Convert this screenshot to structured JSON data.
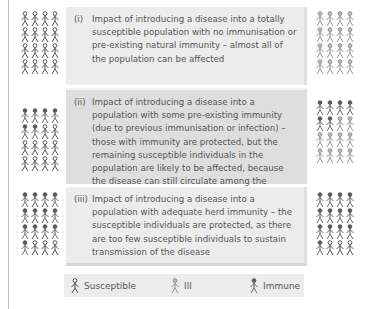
{
  "panels": [
    {
      "number": "(i)",
      "text": "Impact of introducing a disease into a totally susceptible population with no immunisation or pre-existing natural immunity – almost all of the population can be affected",
      "before": {
        "susceptible": 16,
        "ill": 0,
        "immune": 0
      },
      "after": {
        "susceptible": 0,
        "ill": 16,
        "immune": 0
      }
    },
    {
      "number": "(ii)",
      "text": "Impact of introducing a disease into a population with some pre-existing immunity (due to previous immunisation or infection) – those with immunity are protected, but the remaining susceptible individuals in the population are likely to be affected, because the disease can still circulate among the susceptible population",
      "before": {
        "susceptible": 10,
        "ill": 0,
        "immune": 6
      },
      "after": {
        "susceptible": 0,
        "ill": 10,
        "immune": 6
      }
    },
    {
      "number": "(iii)",
      "text": "Impact of introducing a disease into a population with adequate herd immunity – the susceptible individuals are protected, as there are too few susceptible individuals to sustain transmission of the disease",
      "before": {
        "susceptible": 3,
        "ill": 0,
        "immune": 13
      },
      "after": {
        "susceptible": 3,
        "ill": 0,
        "immune": 13
      }
    }
  ],
  "legend": {
    "susceptible": "Susceptible",
    "ill": "Ill",
    "immune": "Immune"
  },
  "colors": {
    "susceptible": "#444444",
    "ill": "#8a8a8a",
    "immune": "#5a5a5a",
    "panel_bg": "#ececec",
    "panel_mid_bg": "#dedede"
  }
}
